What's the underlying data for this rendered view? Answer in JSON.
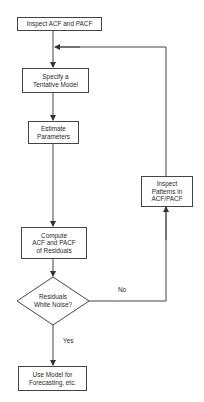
{
  "flowchart": {
    "nodes": {
      "inspect_acf_pacf": "Inspect ACF and PACF",
      "specify_model": "Specify a\nTentative Model",
      "estimate_parameters": "Estimate\nParameters",
      "inspect_patterns": "Inspect\nPatterns in\nACF/PACF",
      "compute_residual_acf": "Compute\nACF and PACF\nof Residuals",
      "residuals_white_noise": "Residuals\nWhite Noise?",
      "use_model": "Use Model for\nForecasting, etc."
    },
    "edge_labels": {
      "no": "No",
      "yes": "Yes"
    },
    "colors": {
      "line": "#444444",
      "background": "#ffffff"
    }
  }
}
